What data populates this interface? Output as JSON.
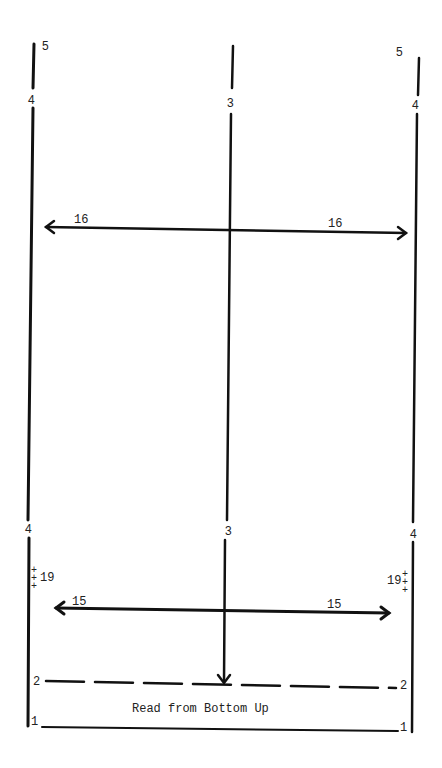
{
  "diagram": {
    "caption": "Read from Bottom Up",
    "stroke_color": "#111111",
    "labels": {
      "top_left_5": "5",
      "top_right_5": "5",
      "upper_left_4": "4",
      "upper_center_3": "3",
      "upper_right_4": "4",
      "lower_left_4": "4",
      "lower_center_3": "3",
      "lower_right_4": "4",
      "arrow_upper_left_16": "16",
      "arrow_upper_right_16": "16",
      "arrow_lower_left_15": "15",
      "arrow_lower_right_15": "15",
      "marker_left_19": "19",
      "marker_right_19": "19",
      "dash_left_2": "2",
      "dash_right_2": "2",
      "base_left_1": "1",
      "base_right_1": "1"
    }
  }
}
